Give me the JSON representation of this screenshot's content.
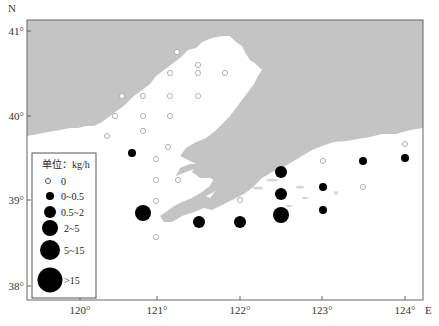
{
  "map": {
    "north_label": "N",
    "east_label": "E",
    "colors": {
      "land": "#c4c4c4",
      "sea": "#ffffff",
      "frame": "#666666",
      "marker_fill": "#000000",
      "empty_marker": "#aaaaaa"
    },
    "lat_ticks": [
      {
        "label": "41°",
        "y": 31
      },
      {
        "label": "40°",
        "y": 116
      },
      {
        "label": "39°",
        "y": 200
      },
      {
        "label": "38°",
        "y": 286
      }
    ],
    "lon_ticks": [
      {
        "label": "120°",
        "x": 80
      },
      {
        "label": "121°",
        "x": 157
      },
      {
        "label": "122°",
        "x": 240
      },
      {
        "label": "123°",
        "x": 322
      },
      {
        "label": "124°",
        "x": 405
      }
    ]
  },
  "legend": {
    "title": "单位：kg/h",
    "items": [
      {
        "label": "0",
        "r": 2.5,
        "filled": false
      },
      {
        "label": "0~0.5",
        "r": 4,
        "filled": true
      },
      {
        "label": "0.5~2",
        "r": 6,
        "filled": true
      },
      {
        "label": "2~5",
        "r": 8,
        "filled": true
      },
      {
        "label": "5~15",
        "r": 10,
        "filled": true
      },
      {
        "label": ">15",
        "r": 12.5,
        "filled": true
      }
    ]
  },
  "stations": {
    "zero": [
      [
        177,
        52
      ],
      [
        198,
        65
      ],
      [
        170,
        73
      ],
      [
        198,
        73
      ],
      [
        225,
        73
      ],
      [
        122,
        96
      ],
      [
        143,
        96
      ],
      [
        170,
        96
      ],
      [
        198,
        96
      ],
      [
        115,
        116
      ],
      [
        143,
        116
      ],
      [
        170,
        116
      ],
      [
        107,
        136
      ],
      [
        143,
        131
      ],
      [
        168,
        147
      ],
      [
        156,
        159
      ],
      [
        156,
        180
      ],
      [
        178,
        180
      ],
      [
        156,
        201
      ],
      [
        240,
        200
      ],
      [
        156,
        237
      ],
      [
        405,
        144
      ],
      [
        323,
        161
      ],
      [
        363,
        187
      ]
    ],
    "catch": [
      {
        "x": 132,
        "y": 153,
        "class": "0~0.5"
      },
      {
        "x": 323,
        "y": 187,
        "class": "0~0.5"
      },
      {
        "x": 323,
        "y": 210,
        "class": "0~0.5"
      },
      {
        "x": 363,
        "y": 161,
        "class": "0~0.5"
      },
      {
        "x": 405,
        "y": 158,
        "class": "0~0.5"
      },
      {
        "x": 281,
        "y": 172,
        "class": "0.5~2"
      },
      {
        "x": 281,
        "y": 194,
        "class": "0.5~2"
      },
      {
        "x": 240,
        "y": 222,
        "class": "0.5~2"
      },
      {
        "x": 199,
        "y": 222,
        "class": "0.5~2"
      },
      {
        "x": 143,
        "y": 213,
        "class": "2~5"
      },
      {
        "x": 281,
        "y": 215,
        "class": "2~5"
      }
    ]
  }
}
